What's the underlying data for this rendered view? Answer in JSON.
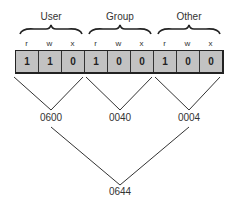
{
  "groups": [
    {
      "label": "User",
      "perms": [
        "r",
        "w",
        "x"
      ],
      "bits": [
        "1",
        "1",
        "0"
      ],
      "octal": "0600"
    },
    {
      "label": "Group",
      "perms": [
        "r",
        "w",
        "x"
      ],
      "bits": [
        "1",
        "0",
        "0"
      ],
      "octal": "0040"
    },
    {
      "label": "Other",
      "perms": [
        "r",
        "w",
        "x"
      ],
      "bits": [
        "1",
        "0",
        "0"
      ],
      "octal": "0004"
    }
  ],
  "total": "0644"
}
